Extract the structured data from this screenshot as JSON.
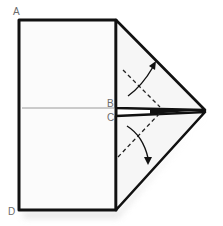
{
  "diagram": {
    "type": "paper-folding-instruction",
    "labels": {
      "a": "A",
      "b": "B",
      "c": "C",
      "d": "D"
    },
    "colors": {
      "outline": "#111111",
      "paper": "#fbfbfb",
      "centerline": "#9a9a9a",
      "label": "#6b6b6b",
      "shadow": "#d9d9d9"
    },
    "elements": {
      "rectangle": "folded-paper-body",
      "top_flap": "upper-triangle-flap",
      "bottom_flap": "lower-triangle-flap",
      "top_fold_line": "dashed-fold-line",
      "bottom_fold_line": "dashed-fold-line",
      "top_arrow": "curved-fold-arrow-up",
      "bottom_arrow": "curved-fold-arrow-down",
      "centerline": "center-crease"
    }
  }
}
